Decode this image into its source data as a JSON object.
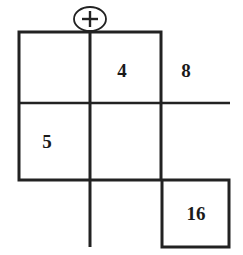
{
  "figure": {
    "background_color": "#ffffff",
    "line_color": "#222222",
    "text_color": "#1a1a1a",
    "canvas": {
      "width": 243,
      "height": 255
    },
    "operator_badge": {
      "symbol": "+",
      "icon_name": "plus-in-ellipse-icon",
      "center_x": 90,
      "center_y": 19,
      "rx": 16,
      "ry": 12
    },
    "cells": [
      {
        "name": "cell-top-left",
        "value": "",
        "x": 19,
        "y": 32,
        "w": 71,
        "h": 71
      },
      {
        "name": "cell-top-middle",
        "value": "4",
        "x": 90,
        "y": 32,
        "w": 71,
        "h": 71
      },
      {
        "name": "cell-mid-left",
        "value": "5",
        "x": 19,
        "y": 103,
        "w": 71,
        "h": 77
      },
      {
        "name": "cell-mid-middle",
        "value": "",
        "x": 90,
        "y": 103,
        "w": 71,
        "h": 77
      },
      {
        "name": "cell-bottom-right",
        "value": "16",
        "x": 162,
        "y": 180,
        "w": 67,
        "h": 67
      }
    ],
    "labels": [
      {
        "name": "value-4",
        "text": "4",
        "x": 122,
        "y": 70,
        "inside_grid": true
      },
      {
        "name": "value-8",
        "text": "8",
        "x": 186,
        "y": 70,
        "inside_grid": false
      },
      {
        "name": "value-5",
        "text": "5",
        "x": 47,
        "y": 141,
        "inside_grid": true
      },
      {
        "name": "value-16",
        "text": "16",
        "x": 196,
        "y": 213,
        "inside_grid": true
      }
    ],
    "strokes": {
      "outer_width": 3,
      "inner_width": 3,
      "extension_width": 2.5
    },
    "geometry": {
      "grid_left": 19,
      "grid_top": 32,
      "grid_right": 161,
      "grid_bottom": 180,
      "v_mid_x": 90,
      "h_mid_y": 103,
      "v_extend_bottom": 247,
      "h_extend_right": 230,
      "box16_left": 162,
      "box16_top": 180,
      "box16_right": 229,
      "box16_bottom": 247
    }
  }
}
